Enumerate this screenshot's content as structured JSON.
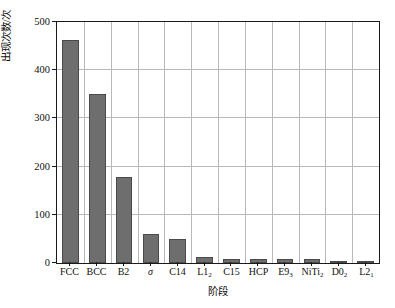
{
  "chart_data": {
    "type": "bar",
    "title": "",
    "xlabel": "阶段",
    "ylabel": "出现次数/次",
    "categories": [
      "FCC",
      "BCC",
      "B2",
      "σ",
      "C14",
      "L1₂",
      "C15",
      "HCP",
      "E9₃",
      "NiTi₂",
      "D0₂",
      "L2₁"
    ],
    "category_parts": [
      {
        "base": "FCC",
        "sub": ""
      },
      {
        "base": "BCC",
        "sub": ""
      },
      {
        "base": "B2",
        "sub": ""
      },
      {
        "base": "σ",
        "sub": "",
        "italic": true
      },
      {
        "base": "C14",
        "sub": ""
      },
      {
        "base": "L1",
        "sub": "2"
      },
      {
        "base": "C15",
        "sub": ""
      },
      {
        "base": "HCP",
        "sub": ""
      },
      {
        "base": "E9",
        "sub": "3"
      },
      {
        "base": "NiTi",
        "sub": "2"
      },
      {
        "base": "D0",
        "sub": "2"
      },
      {
        "base": "L2",
        "sub": "1"
      }
    ],
    "values": [
      463,
      350,
      178,
      60,
      49,
      12,
      8,
      8,
      8,
      8,
      5,
      4
    ],
    "ylim": [
      0,
      500
    ],
    "yticks": [
      0,
      100,
      200,
      300,
      400,
      500
    ],
    "ytick_labels": [
      "0",
      "100",
      "200",
      "300",
      "400",
      "500"
    ],
    "grid": true,
    "legend": "none",
    "bar_color": "#6e6e6e",
    "bar_edge_color": "#4a4a4a",
    "grid_color": "#b9b9b9",
    "axis_color": "#1a1a1a"
  }
}
